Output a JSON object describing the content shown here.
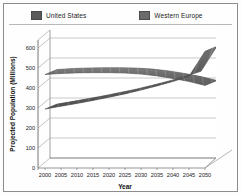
{
  "chart_data": {
    "type": "line",
    "title": "",
    "subtitle": "",
    "xlabel": "Year",
    "ylabel": "Projected Population (Millions)",
    "xlim": [
      2000,
      2050
    ],
    "ylim": [
      0,
      600
    ],
    "ytick_labels": [
      "0",
      "100",
      "200",
      "300",
      "400",
      "500",
      "600"
    ],
    "yticks": [
      0,
      100,
      200,
      300,
      400,
      500,
      600
    ],
    "x": [
      2000,
      2005,
      2010,
      2015,
      2020,
      2025,
      2030,
      2035,
      2040,
      2045,
      2050
    ],
    "xtick_labels": [
      "2000",
      "2005",
      "2010",
      "2015",
      "2020",
      "2025",
      "2030",
      "2035",
      "2040",
      "2045",
      "2050"
    ],
    "grid": true,
    "grid_axis": "y",
    "legend_position": "top",
    "style": "3d-ribbon",
    "series": [
      {
        "name": "United States",
        "color": "#5a5a5a",
        "values": [
          282,
          296,
          310,
          325,
          341,
          358,
          377,
          398,
          420,
          446,
          571
        ]
      },
      {
        "name": "Western Europe",
        "color": "#6b6b6b",
        "values": [
          455,
          460,
          463,
          464,
          464,
          462,
          457,
          448,
          435,
          420,
          400
        ]
      }
    ]
  },
  "legend": {
    "entries": [
      {
        "label": "United States",
        "color": "#5a5a5a"
      },
      {
        "label": "Western Europe",
        "color": "#6b6b6b"
      }
    ]
  },
  "axes": {
    "y_title": "Projected Population (Millions)",
    "x_title": "Year"
  },
  "colors": {
    "frame": "#8c8c8c",
    "gridline": "#b0b0b0",
    "axis": "#5f5f5f",
    "background": "#fefefe",
    "series_us": "#5a5a5a",
    "series_we": "#6b6b6b"
  }
}
